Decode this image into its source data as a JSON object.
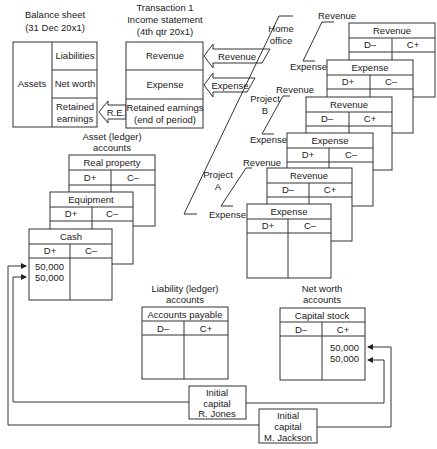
{
  "balance_sheet": {
    "title_line1": "Balance sheet",
    "title_line2": "(31 Dec 20x1)",
    "assets": "Assets",
    "liabilities": "Liabilities",
    "net_worth": "Net worth",
    "retained_line1": "Retained",
    "retained_line2": "earnings"
  },
  "income_statement": {
    "title_line1": "Transaction 1",
    "title_line2": "Income statement",
    "title_line3": "(4th qtr 20x1)",
    "revenue": "Revenue",
    "expense": "Expense",
    "retained_line1": "Retained earnings",
    "retained_line2": "(end of period)"
  },
  "arrows": {
    "revenue": "Revenue",
    "expense": "Expense",
    "re": "R.E."
  },
  "sources": {
    "home_office_line1": "Home",
    "home_office_line2": "office",
    "project_b_line1": "Project",
    "project_b_line2": "B",
    "project_a_line1": "Project",
    "project_a_line2": "A",
    "revenue": "Revenue",
    "expense": "Expense"
  },
  "t_accounts": {
    "ho_revenue": {
      "title": "Revenue",
      "left": "D–",
      "right": "C+"
    },
    "ho_expense": {
      "title": "Expense",
      "left": "D+",
      "right": "C–"
    },
    "pb_revenue": {
      "title": "Revenue",
      "left": "D–",
      "right": "C+"
    },
    "pb_expense": {
      "title": "Expense",
      "left": "D+",
      "right": "C–"
    },
    "pa_revenue": {
      "title": "Revenue",
      "left": "D–",
      "right": "C+"
    },
    "pa_expense": {
      "title": "Expense",
      "left": "D+",
      "right": "C–"
    },
    "real_property": {
      "title": "Real property",
      "left": "D+",
      "right": "C–"
    },
    "equipment": {
      "title": "Equipment",
      "left": "D+",
      "right": "C–"
    },
    "cash": {
      "title": "Cash",
      "left": "D+",
      "right": "C–",
      "entries": [
        "50,000",
        "50,000"
      ]
    },
    "accounts_payable": {
      "title": "Accounts payable",
      "left": "D–",
      "right": "C+"
    },
    "capital_stock": {
      "title": "Capital stock",
      "left": "D–",
      "right": "C+",
      "entries": [
        "50,000",
        "50,000"
      ]
    }
  },
  "groups": {
    "asset_line1": "Asset (ledger)",
    "asset_line2": "accounts",
    "liability_line1": "Liability (ledger)",
    "liability_line2": "accounts",
    "networth_line1": "Net worth",
    "networth_line2": "accounts"
  },
  "transactions": {
    "jones": {
      "line1": "Initial",
      "line2": "capital",
      "line3": "R. Jones"
    },
    "jackson": {
      "line1": "Initial",
      "line2": "capital",
      "line3": "M. Jackson"
    }
  }
}
